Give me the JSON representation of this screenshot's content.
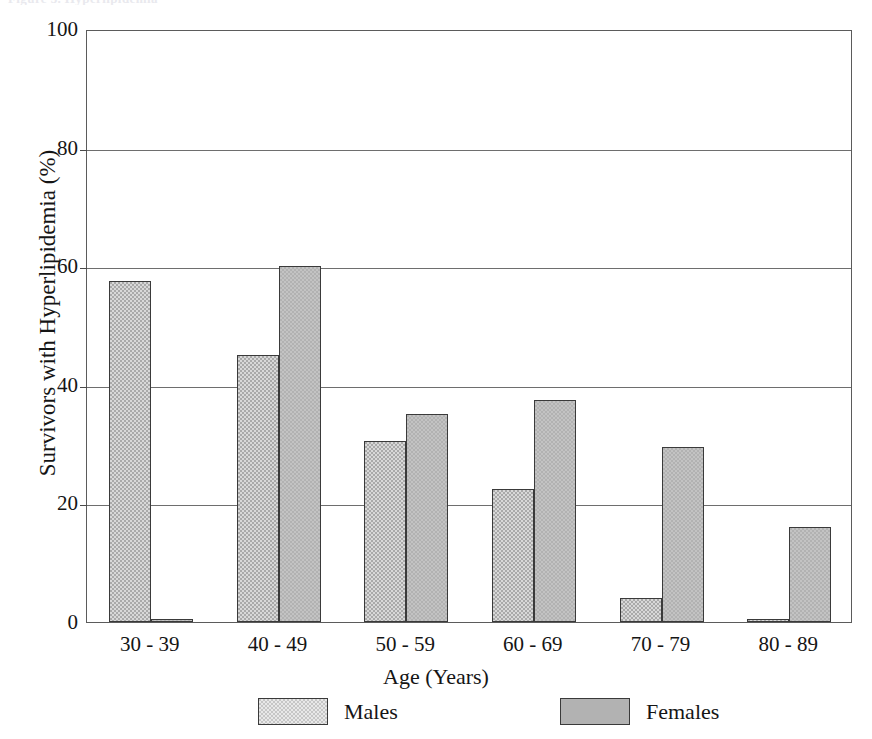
{
  "figure": {
    "top_caption_remnant": "Figure 3. Hyperlipidemia",
    "background_color": "#ffffff"
  },
  "chart_data": {
    "type": "bar",
    "title": "",
    "xlabel": "Age (Years)",
    "ylabel": "Survivors with Hyperlipidemia (%)",
    "categories": [
      "30-39",
      "40-49",
      "50-59",
      "60-69",
      "70-79",
      "80-89"
    ],
    "series": [
      {
        "name": "Males",
        "color": "#c6c6c6",
        "values": [
          57.5,
          45.0,
          30.5,
          22.5,
          4.0,
          0.3
        ]
      },
      {
        "name": "Females",
        "color": "#b2b2b2",
        "values": [
          0.5,
          60.0,
          35.0,
          37.5,
          29.5,
          16.0
        ]
      }
    ],
    "ylim": [
      0,
      100
    ],
    "yticks": [
      0,
      20,
      40,
      60,
      80,
      100
    ],
    "ytick_labels": [
      "0",
      "20",
      "40",
      "60",
      "80",
      "100"
    ],
    "grid": true,
    "legend_position": "bottom"
  },
  "legend": {
    "items": [
      {
        "label": "Males"
      },
      {
        "label": "Females"
      }
    ]
  }
}
